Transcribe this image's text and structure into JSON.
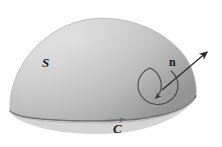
{
  "figure": {
    "kind": "stokes-theorem-diagram",
    "caption_labels": {
      "surface": "S",
      "boundary_curve": "C",
      "normal_vector": "n"
    },
    "colors": {
      "background": "#ffffff",
      "surface_light": "#e4e4e4",
      "surface_mid": "#cfcfcf",
      "surface_dark": "#b2b2b2",
      "surface_edge": "#8f8f8f",
      "base_shadow": "#bdbdbd",
      "outline": "#7c7c7c",
      "ink": "#1a1a1a"
    },
    "geometry": {
      "dome_apex": [
        104,
        19
      ],
      "dome_left": [
        10,
        112
      ],
      "dome_right": [
        196,
        96
      ],
      "base_ellipse_center": [
        100,
        112
      ],
      "base_ellipse_rx": 92,
      "base_ellipse_ry": 22,
      "normal_arrow_start": [
        166,
        86
      ],
      "normal_arrow_tip": [
        208,
        51
      ],
      "circulation_circle_center": [
        159,
        82
      ],
      "circulation_circle_r": 20,
      "boundary_arrow_at": [
        118,
        119
      ]
    }
  }
}
